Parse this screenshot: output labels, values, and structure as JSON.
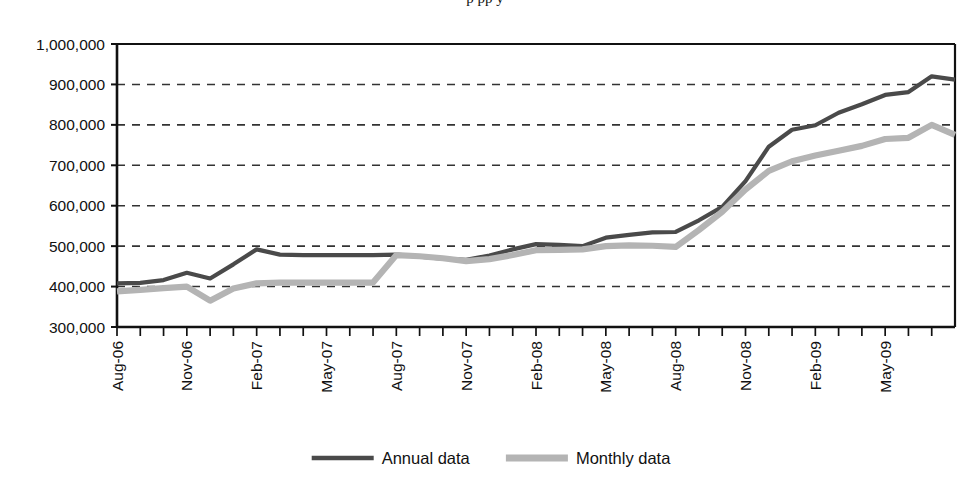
{
  "figure": {
    "partial_title_top": "p             pp          y",
    "background_color": "#ffffff"
  },
  "legend": {
    "position": "bottom-center",
    "items": [
      {
        "label": "Annual data",
        "color": "#4a4a4a",
        "swatch_name": "annual-data-swatch"
      },
      {
        "label": "Monthly data",
        "color": "#b4b4b4",
        "swatch_name": "monthly-data-swatch"
      }
    ]
  },
  "axes": {
    "y_tick_labels": [
      "1,000,000",
      "900,000",
      "800,000",
      "700,000",
      "600,000",
      "500,000",
      "400,000",
      "300,000"
    ],
    "x_tick_labels": [
      "Aug-06",
      "Nov-06",
      "Feb-07",
      "May-07",
      "Aug-07",
      "Nov-07",
      "Feb-08",
      "May-08",
      "Aug-08",
      "Nov-08",
      "Feb-09",
      "May-09"
    ]
  },
  "chart_data": {
    "type": "line",
    "title": "",
    "xlabel": "",
    "ylabel": "",
    "ylim": [
      300000,
      1000000
    ],
    "ytick_step": 100000,
    "grid": "horizontal-dashed",
    "legend_position": "bottom-center",
    "x": [
      "Aug-06",
      "Sep-06",
      "Oct-06",
      "Nov-06",
      "Dec-06",
      "Jan-07",
      "Feb-07",
      "Mar-07",
      "Apr-07",
      "May-07",
      "Jun-07",
      "Jul-07",
      "Aug-07",
      "Sep-07",
      "Oct-07",
      "Nov-07",
      "Dec-07",
      "Jan-08",
      "Feb-08",
      "Mar-08",
      "Apr-08",
      "May-08",
      "Jun-08",
      "Jul-08",
      "Aug-08",
      "Sep-08",
      "Oct-08",
      "Nov-08",
      "Dec-08",
      "Jan-09",
      "Feb-09",
      "Mar-09",
      "Apr-09",
      "May-09",
      "Jun-09",
      "Jul-09"
    ],
    "series": [
      {
        "name": "Annual data",
        "color": "#4a4a4a",
        "values": [
          408000,
          409000,
          416000,
          434000,
          420000,
          455000,
          492000,
          479000,
          478000,
          478000,
          478000,
          478000,
          479000,
          474000,
          469000,
          466000,
          477000,
          492000,
          505000,
          503000,
          500000,
          521000,
          528000,
          534000,
          535000,
          564000,
          597000,
          661000,
          746000,
          788000,
          799000,
          830000,
          851000,
          874000,
          881000,
          920000
        ],
        "end_value": 912000
      },
      {
        "name": "Monthly data",
        "color": "#b4b4b4",
        "values": [
          388000,
          392000,
          396000,
          400000,
          365000,
          395000,
          408000,
          410000,
          410000,
          410000,
          410000,
          410000,
          478000,
          475000,
          470000,
          463000,
          468000,
          478000,
          490000,
          491000,
          492000,
          500000,
          502000,
          501000,
          498000,
          540000,
          585000,
          640000,
          686000,
          710000,
          724000,
          736000,
          748000,
          765000,
          768000,
          800000
        ],
        "end_value": 775000
      }
    ]
  }
}
